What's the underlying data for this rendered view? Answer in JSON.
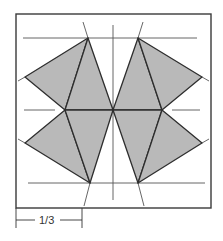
{
  "diagram": {
    "type": "quilt-block-geometry",
    "colors": {
      "fill": "#b9b9b9",
      "outline": "#2e2e2e",
      "guide": "#555555",
      "frame": "#3a3a3a",
      "background": "#ffffff"
    },
    "frame": {
      "x": 16,
      "y": 14,
      "width": 195,
      "height": 194
    },
    "guide_lines": {
      "top_horizontal": {
        "x1": 23,
        "y1": 38,
        "x2": 197,
        "y2": 38
      },
      "bottom_horizontal": {
        "x1": 28,
        "y1": 183,
        "x2": 205,
        "y2": 183
      },
      "middle_left": {
        "x1": 24,
        "y1": 110,
        "x2": 55,
        "y2": 110
      },
      "middle_right": {
        "x1": 172,
        "y1": 110,
        "x2": 200,
        "y2": 110
      },
      "center_vertical": {
        "x1": 113,
        "y1": 25,
        "x2": 113,
        "y2": 200
      }
    },
    "vertices": {
      "top_left": [
        88,
        38
      ],
      "top_right": [
        138,
        38
      ],
      "outer_left_upper": [
        25,
        77
      ],
      "outer_left_lower": [
        25,
        143
      ],
      "outer_right_upper": [
        202,
        77
      ],
      "outer_right_lower": [
        202,
        143
      ],
      "mid_left": [
        65,
        110
      ],
      "center": [
        113,
        110
      ],
      "mid_right": [
        162,
        110
      ],
      "bottom_left": [
        90,
        183
      ],
      "bottom_right": [
        138,
        183
      ]
    },
    "dimension": {
      "label": "1/3",
      "x1": 16,
      "x2": 82,
      "y": 220
    }
  }
}
